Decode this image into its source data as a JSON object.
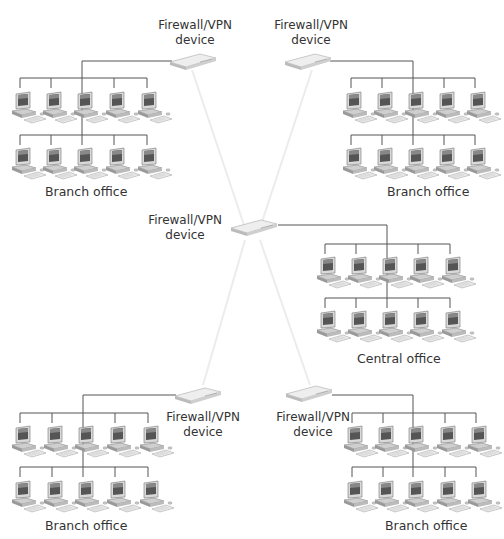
{
  "diagram": {
    "type": "network-topology",
    "colors": {
      "line": "#555555",
      "tunnel": "#eeeeee",
      "device": "#e4e4e4"
    },
    "devices": [
      {
        "id": "fw-top-left",
        "label_line1": "Firewall/VPN",
        "label_line2": "device"
      },
      {
        "id": "fw-top-right",
        "label_line1": "Firewall/VPN",
        "label_line2": "device"
      },
      {
        "id": "fw-center",
        "label_line1": "Firewall/VPN",
        "label_line2": "device"
      },
      {
        "id": "fw-bottom-left",
        "label_line1": "Firewall/VPN",
        "label_line2": "device"
      },
      {
        "id": "fw-bottom-right",
        "label_line1": "Firewall/VPN",
        "label_line2": "device"
      }
    ],
    "offices": [
      {
        "id": "office-top-left",
        "label": "Branch office",
        "computers": 10
      },
      {
        "id": "office-top-right",
        "label": "Branch office",
        "computers": 10
      },
      {
        "id": "office-center",
        "label": "Central office",
        "computers": 10
      },
      {
        "id": "office-bottom-left",
        "label": "Branch office",
        "computers": 10
      },
      {
        "id": "office-bottom-right",
        "label": "Branch office",
        "computers": 10
      }
    ]
  }
}
